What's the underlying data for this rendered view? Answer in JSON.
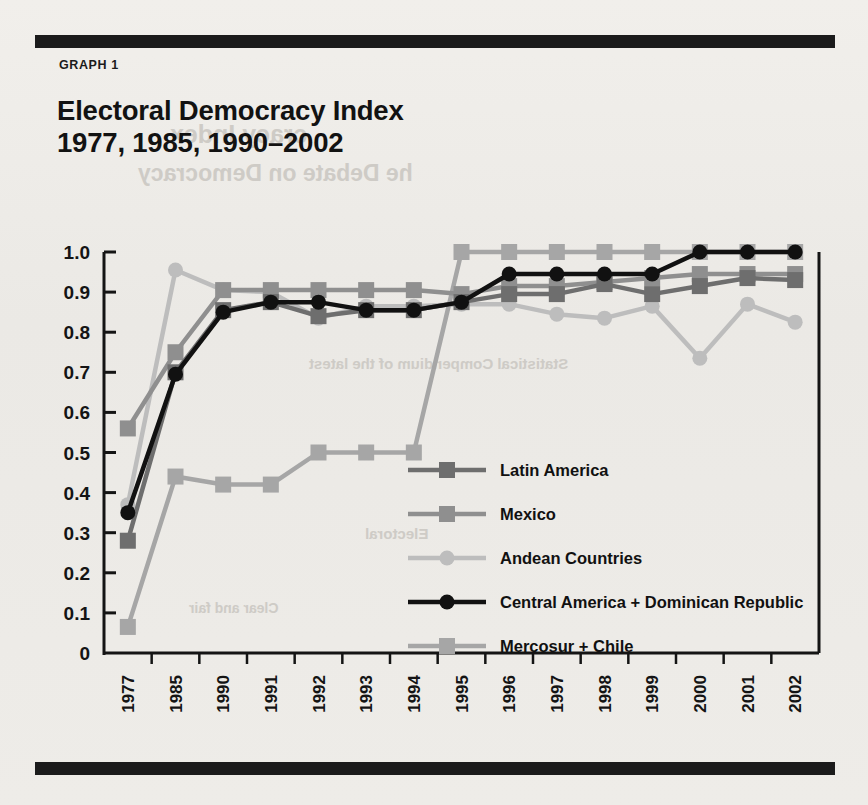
{
  "figure": {
    "label": "GRAPH 1",
    "title_line1": "Electoral Democracy Index",
    "title_line2": "1977, 1985, 1990–2002",
    "title": "Electoral Democracy Index\n1977, 1985, 1990–2002"
  },
  "colors": {
    "page_background": "#eeece8",
    "rule": "#1b1b1b",
    "axis": "#141414",
    "latin_america": "#6e6e6e",
    "mexico": "#8f8f8f",
    "andean": "#bdbdbd",
    "central_america_dr": "#111111",
    "mercosur_chile": "#a6a6a6"
  },
  "chart_data": {
    "type": "line",
    "title": "Electoral Democracy Index 1977, 1985, 1990–2002",
    "xlabel": "",
    "ylabel": "",
    "ylim": [
      0,
      1.0
    ],
    "grid": false,
    "legend_position": "inside-center-right",
    "categories": [
      "1977",
      "1985",
      "1990",
      "1991",
      "1992",
      "1993",
      "1994",
      "1995",
      "1996",
      "1997",
      "1998",
      "1999",
      "2000",
      "2001",
      "2002"
    ],
    "x_tick_labels": [
      "1977",
      "1985",
      "1990",
      "1991",
      "1992",
      "1993",
      "1994",
      "1995",
      "1996",
      "1997",
      "1998",
      "1999",
      "2000",
      "2001",
      "2002"
    ],
    "y_tick_labels": [
      "0",
      "0.1",
      "0.2",
      "0.3",
      "0.4",
      "0.5",
      "0.6",
      "0.7",
      "0.8",
      "0.9",
      "1.0"
    ],
    "y_ticks": [
      0,
      0.1,
      0.2,
      0.3,
      0.4,
      0.5,
      0.6,
      0.7,
      0.8,
      0.9,
      1.0
    ],
    "series": [
      {
        "name": "Latin America",
        "color": "#6e6e6e",
        "marker": "square",
        "values": [
          0.28,
          0.7,
          0.855,
          0.875,
          0.84,
          0.855,
          0.855,
          0.875,
          0.895,
          0.895,
          0.92,
          0.895,
          0.915,
          0.935,
          0.93
        ]
      },
      {
        "name": "Mexico",
        "color": "#8f8f8f",
        "marker": "square",
        "values": [
          0.56,
          0.75,
          0.905,
          0.905,
          0.905,
          0.905,
          0.905,
          0.895,
          0.915,
          0.915,
          0.925,
          0.935,
          0.945,
          0.945,
          0.945
        ]
      },
      {
        "name": "Andean Countries",
        "color": "#bdbdbd",
        "marker": "circle",
        "values": [
          0.37,
          0.955,
          0.905,
          0.9,
          0.835,
          0.865,
          0.865,
          0.87,
          0.87,
          0.845,
          0.835,
          0.865,
          0.735,
          0.87,
          0.825
        ]
      },
      {
        "name": "Central America + Dominican Republic",
        "color": "#111111",
        "marker": "circle",
        "values": [
          0.35,
          0.695,
          0.85,
          0.875,
          0.875,
          0.855,
          0.855,
          0.875,
          0.945,
          0.945,
          0.945,
          0.945,
          1.0,
          1.0,
          1.0
        ]
      },
      {
        "name": "Mercosur + Chile",
        "color": "#a6a6a6",
        "marker": "square",
        "values": [
          0.065,
          0.44,
          0.42,
          0.42,
          0.5,
          0.5,
          0.5,
          1.0,
          1.0,
          1.0,
          1.0,
          1.0,
          1.0,
          1.0,
          1.0
        ]
      }
    ]
  },
  "ghost_text": {
    "g1": "cracy Index",
    "g2": "he Debate on Democracy",
    "g3": "Statistical Compendium of the latest",
    "g4": "Electoral",
    "g5": "Clear and fair"
  }
}
